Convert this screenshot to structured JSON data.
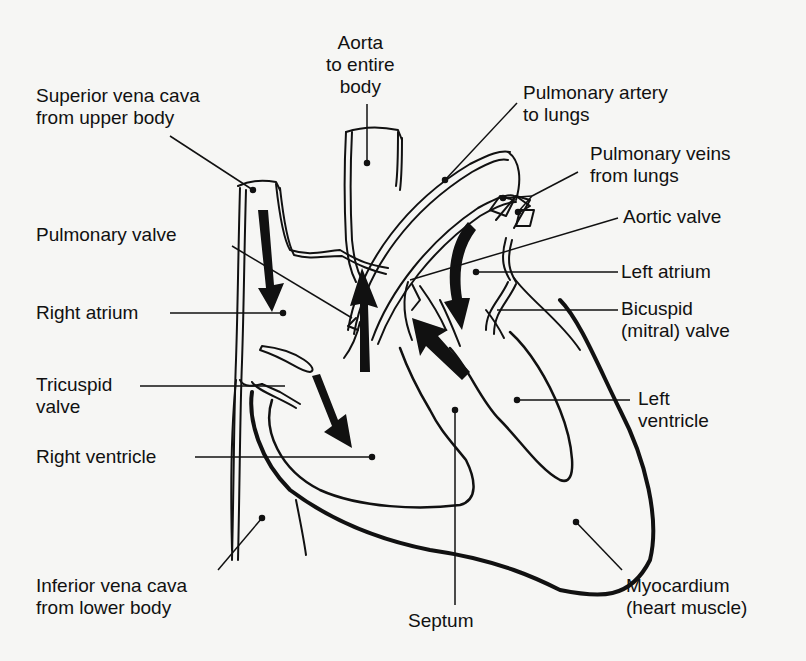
{
  "diagram": {
    "labels": {
      "aorta": [
        "Aorta",
        "to entire",
        "body"
      ],
      "superior_vena_cava": [
        "Superior vena cava",
        "from upper body"
      ],
      "pulmonary_artery": [
        "Pulmonary artery",
        "to lungs"
      ],
      "pulmonary_veins": [
        "Pulmonary veins",
        "from lungs"
      ],
      "aortic_valve": [
        "Aortic valve"
      ],
      "pulmonary_valve": [
        "Pulmonary valve"
      ],
      "left_atrium": [
        "Left atrium"
      ],
      "right_atrium": [
        "Right atrium"
      ],
      "bicuspid_valve": [
        "Bicuspid",
        "(mitral) valve"
      ],
      "tricuspid_valve": [
        "Tricuspid",
        "valve"
      ],
      "left_ventricle": [
        "Left",
        "ventricle"
      ],
      "right_ventricle": [
        "Right ventricle"
      ],
      "inferior_vena_cava": [
        "Inferior vena cava",
        "from lower body"
      ],
      "myocardium": [
        "Myocardium",
        "(heart muscle)"
      ],
      "septum": [
        "Septum"
      ]
    },
    "colors": {
      "ink": "#111111",
      "paper": "#f6f6f4",
      "bleed_text": "#d9d9d6"
    }
  }
}
